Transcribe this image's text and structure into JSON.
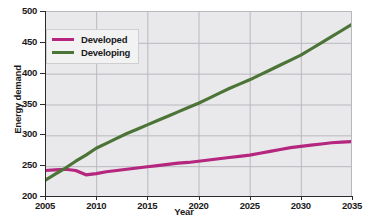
{
  "chart_data": {
    "type": "line",
    "title": "",
    "xlabel": "Year",
    "ylabel": "Energy demand",
    "xlim": [
      2005,
      2035
    ],
    "ylim": [
      200,
      500
    ],
    "xticks": [
      2005,
      2010,
      2015,
      2020,
      2025,
      2030,
      2035
    ],
    "yticks": [
      200,
      250,
      300,
      350,
      400,
      450,
      500
    ],
    "grid": true,
    "legend_position": "top-left",
    "x": [
      2005,
      2006,
      2007,
      2008,
      2009,
      2010,
      2011,
      2012,
      2013,
      2014,
      2015,
      2016,
      2017,
      2018,
      2019,
      2020,
      2021,
      2022,
      2023,
      2024,
      2025,
      2026,
      2027,
      2028,
      2029,
      2030,
      2031,
      2032,
      2033,
      2034,
      2035
    ],
    "series": [
      {
        "name": "Developed",
        "color": "#b5267e",
        "values": [
          243,
          244,
          245,
          243,
          236,
          238,
          241,
          243,
          245,
          247,
          249,
          251,
          253,
          255,
          256,
          258,
          260,
          262,
          264,
          266,
          268,
          271,
          274,
          277,
          280,
          282,
          284,
          286,
          288,
          289,
          290
        ]
      },
      {
        "name": "Developing",
        "color": "#4c7437",
        "values": [
          227,
          237,
          247,
          258,
          268,
          279,
          287,
          295,
          303,
          310,
          317,
          324,
          331,
          338,
          345,
          352,
          360,
          368,
          376,
          383,
          390,
          398,
          406,
          414,
          422,
          430,
          440,
          450,
          460,
          470,
          480
        ]
      }
    ]
  },
  "axes": {
    "y_title": "Energy demand",
    "x_title": "Year",
    "y_tick_labels": [
      "500",
      "450",
      "400",
      "350",
      "300",
      "250",
      "200"
    ],
    "x_tick_labels": [
      "2005",
      "2010",
      "2015",
      "2020",
      "2025",
      "2030",
      "2035"
    ]
  },
  "legend": {
    "items": [
      {
        "label": "Developed",
        "color": "#b5267e"
      },
      {
        "label": "Developing",
        "color": "#4c7437"
      }
    ]
  },
  "colors": {
    "plot_background": "#e9e9ec",
    "grid": "#b9b9be",
    "axis": "#2b2b2b",
    "developed": "#b5267e",
    "developing": "#4c7437"
  }
}
